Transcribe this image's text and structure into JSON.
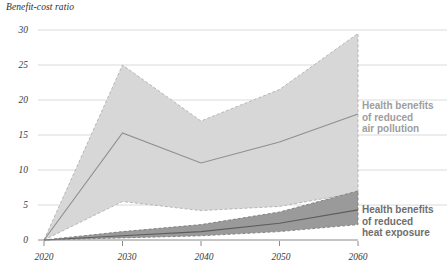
{
  "chart_data": {
    "type": "area",
    "title": "Benefit-cost ratio",
    "xlabel": "",
    "ylabel": "Benefit-cost ratio",
    "x": [
      2020,
      2030,
      2040,
      2050,
      2060
    ],
    "xtick_labels": [
      "2020",
      "2030",
      "2040",
      "2050",
      "2060"
    ],
    "ytick_labels": [
      "0",
      "5",
      "10",
      "15",
      "20",
      "25",
      "30"
    ],
    "yticks": [
      0,
      5,
      10,
      15,
      20,
      25,
      30
    ],
    "xlim": [
      2020,
      2060
    ],
    "ylim": [
      0,
      30
    ],
    "grid": "horizontal",
    "legend_position": "right",
    "series": [
      {
        "name": "Health benefits of reduced air pollution",
        "label": "Health benefits\nof reduced\nair pollution",
        "fill_color": "#d7d7d7",
        "line_color": "#8f8f8f",
        "edge_color": "#b0b0b0",
        "edge_style": "dashed",
        "upper": [
          0,
          25.0,
          17.0,
          21.5,
          29.5
        ],
        "lower": [
          0,
          5.5,
          4.2,
          4.8,
          6.8
        ],
        "values": [
          0,
          15.3,
          11.0,
          14.0,
          18.0
        ]
      },
      {
        "name": "Health benefits of reduced heat exposure",
        "label": "Health benefits\nof reduced\nheat exposure",
        "fill_color": "#9a9a9a",
        "line_color": "#5d5d5d",
        "edge_color": "#7d7d7d",
        "edge_style": "dashed",
        "upper": [
          0,
          1.2,
          2.2,
          4.0,
          7.0
        ],
        "lower": [
          0,
          0.3,
          0.6,
          1.2,
          2.2
        ],
        "values": [
          0,
          0.6,
          1.2,
          2.4,
          4.3
        ]
      }
    ]
  },
  "axis": {
    "title": "Benefit-cost ratio",
    "y_labels": [
      "30",
      "25",
      "20",
      "15",
      "10",
      "5",
      "0"
    ],
    "x_labels": [
      "2020",
      "2030",
      "2040",
      "2050",
      "2060"
    ]
  },
  "legend": {
    "air": "Health benefits\nof reduced\nair pollution",
    "heat": "Health benefits\nof reduced\nheat exposure"
  },
  "colors": {
    "air_fill": "#d7d7d7",
    "air_line": "#8f8f8f",
    "heat_fill": "#9a9a9a",
    "heat_line": "#5d5d5d",
    "grid": "#d0d0d0",
    "axis": "#8a8a8a",
    "legend_air_text": "#9d9d9d",
    "legend_heat_text": "#6e6e6e"
  }
}
